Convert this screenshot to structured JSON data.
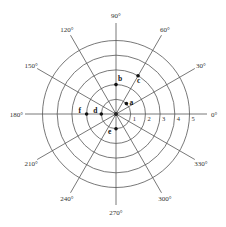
{
  "diagram": {
    "type": "polar-grid",
    "rings": [
      1,
      2,
      3,
      4,
      5
    ],
    "ring_labels": [
      "1",
      "2",
      "3",
      "4",
      "5"
    ],
    "angles": [
      0,
      30,
      60,
      90,
      120,
      150,
      180,
      210,
      240,
      270,
      300,
      330
    ],
    "angle_labels": [
      "0°",
      "30°",
      "60°",
      "90°",
      "120°",
      "150°",
      "180°",
      "210°",
      "240°",
      "270°",
      "300°",
      "330°"
    ],
    "points": [
      {
        "label": "a",
        "r": 1,
        "theta": 45
      },
      {
        "label": "b",
        "r": 2,
        "theta": 90
      },
      {
        "label": "c",
        "r": 3,
        "theta": 60
      },
      {
        "label": "d",
        "r": 1,
        "theta": 180
      },
      {
        "label": "e",
        "r": 1,
        "theta": 270
      },
      {
        "label": "f",
        "r": 2,
        "theta": 180
      }
    ]
  }
}
